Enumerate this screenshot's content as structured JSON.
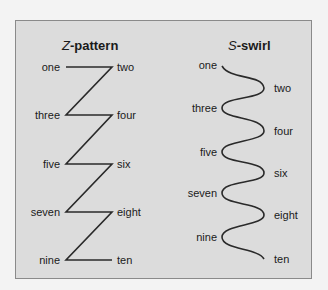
{
  "z_pattern": {
    "title_letter": "Z",
    "title_rest": "-pattern",
    "left_labels": [
      "one",
      "three",
      "five",
      "seven",
      "nine"
    ],
    "right_labels": [
      "two",
      "four",
      "six",
      "eight",
      "ten"
    ]
  },
  "s_swirl": {
    "title_letter": "S",
    "title_rest": "-swirl",
    "left_labels": [
      "one",
      "three",
      "five",
      "seven",
      "nine"
    ],
    "right_labels": [
      "two",
      "four",
      "six",
      "eight",
      "ten"
    ]
  },
  "colors": {
    "panel_bg": "#dcdcdc",
    "panel_border": "#8a8a8a",
    "line": "#2a2a2a",
    "text": "#1a1a1a"
  }
}
